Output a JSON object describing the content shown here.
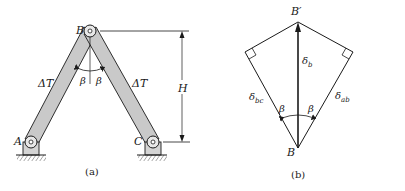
{
  "figure_a": {
    "caption": "(a)",
    "joints": {
      "top": "B",
      "left_support": "A",
      "right_support": "C"
    },
    "members": [
      {
        "name": "AB",
        "label": "ΔT"
      },
      {
        "name": "BC",
        "label": "ΔT"
      }
    ],
    "angles": {
      "left": "β",
      "right": "β"
    },
    "dimension": {
      "label": "H"
    }
  },
  "figure_b": {
    "caption": "(b)",
    "points": {
      "top": "B′",
      "bottom": "B"
    },
    "vectors": {
      "vertical": {
        "symbol": "δ",
        "subscript": "b"
      },
      "left": {
        "symbol": "δ",
        "subscript": "bc"
      },
      "right": {
        "symbol": "δ",
        "subscript": "ab"
      }
    },
    "angles": {
      "left": "β",
      "right": "β"
    }
  },
  "colors": {
    "ink": "#1a1a1a",
    "member_fill": "#c9c9c9",
    "support_fill": "#d4d4d4"
  }
}
